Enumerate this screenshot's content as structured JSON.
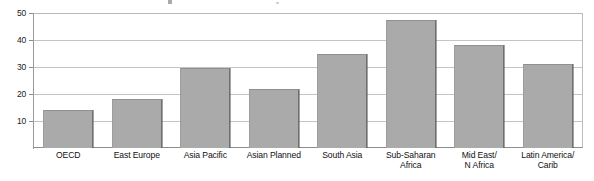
{
  "chart_data": {
    "type": "bar",
    "title": "",
    "subtitle": "",
    "xlabel": "",
    "ylabel": "",
    "ylim": [
      0,
      50
    ],
    "yticks": [
      10,
      20,
      30,
      40,
      50
    ],
    "ytick_labels": [
      "10",
      "20",
      "30",
      "40",
      "50"
    ],
    "grid": true,
    "legend": "none",
    "categories": [
      "OECD",
      "East Europe",
      "Asia Pacific",
      "Asian Planned",
      "South Asia",
      "Sub-Saharan\nAfrica",
      "Mid East/\nN Africa",
      "Latin America/\nCarib"
    ],
    "values": [
      14,
      18,
      29.5,
      22,
      35,
      47.5,
      38,
      31
    ],
    "bar_color": "#aaaaaa",
    "bar_edge_color": "#6f6f6f",
    "plot_background": "#ffffff",
    "grid_color": "#c4c4c4",
    "axis_color": "#8d8d8d"
  }
}
